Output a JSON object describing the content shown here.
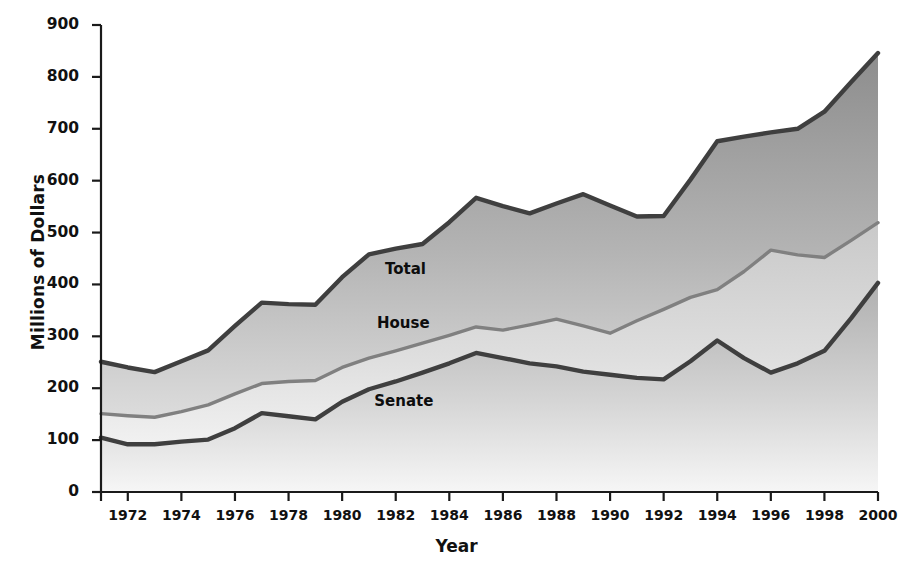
{
  "chart_data": {
    "type": "area",
    "title": "",
    "xlabel": "Year",
    "ylabel": "Millions of Dollars",
    "xlim": [
      1971,
      2000
    ],
    "ylim": [
      0,
      900
    ],
    "grid": false,
    "legend_position": "inline-annotations",
    "stacking": "cumulative-bands",
    "x": [
      1971,
      1972,
      1973,
      1974,
      1975,
      1976,
      1977,
      1978,
      1979,
      1980,
      1981,
      1982,
      1983,
      1984,
      1985,
      1986,
      1987,
      1988,
      1989,
      1990,
      1991,
      1992,
      1993,
      1994,
      1995,
      1996,
      1997,
      1998,
      1999,
      2000
    ],
    "x_tick_labels": [
      "1972",
      "1974",
      "1976",
      "1978",
      "1980",
      "1982",
      "1984",
      "1986",
      "1988",
      "1990",
      "1992",
      "1994",
      "1996",
      "1998",
      "2000"
    ],
    "x_tick_values": [
      1972,
      1974,
      1976,
      1978,
      1980,
      1982,
      1984,
      1986,
      1988,
      1990,
      1992,
      1994,
      1996,
      1998,
      2000
    ],
    "y_tick_labels": [
      "0",
      "100",
      "200",
      "300",
      "400",
      "500",
      "600",
      "700",
      "800",
      "900"
    ],
    "y_tick_values": [
      0,
      100,
      200,
      300,
      400,
      500,
      600,
      700,
      800,
      900
    ],
    "series": [
      {
        "name": "Senate",
        "label": "Senate",
        "color": "#3f3f3f",
        "fill_top": "#b6b6b6",
        "fill_bottom": "#f3f3f3",
        "values": [
          105,
          92,
          92,
          97,
          101,
          123,
          152,
          146,
          140,
          174,
          198,
          213,
          230,
          248,
          268,
          258,
          248,
          242,
          232,
          226,
          220,
          217,
          252,
          292,
          258,
          230,
          248,
          272,
          335,
          403
        ]
      },
      {
        "name": "House",
        "label": "House",
        "color": "#808080",
        "fill_top": "#cfcfcf",
        "fill_bottom": "#f0f0f0",
        "values": [
          151,
          147,
          144,
          155,
          168,
          189,
          209,
          213,
          215,
          240,
          258,
          272,
          287,
          302,
          318,
          312,
          322,
          333,
          320,
          306,
          330,
          352,
          375,
          390,
          425,
          466,
          457,
          452,
          485,
          519
        ]
      },
      {
        "name": "Total",
        "label": "Total",
        "color": "#3f3f3f",
        "fill_top": "#8f8f8f",
        "fill_bottom": "#d8d8d8",
        "values": [
          251,
          240,
          231,
          252,
          273,
          320,
          365,
          362,
          361,
          414,
          458,
          469,
          478,
          520,
          567,
          551,
          537,
          556,
          574,
          552,
          531,
          532,
          602,
          676,
          685,
          693,
          700,
          733,
          790,
          846
        ]
      }
    ],
    "annotations": [
      {
        "text": "Total",
        "x": 1981.6,
        "y": 430
      },
      {
        "text": "House",
        "x": 1981.3,
        "y": 325
      },
      {
        "text": "Senate",
        "x": 1981.2,
        "y": 175
      }
    ]
  },
  "axes": {
    "x_title": "Year",
    "y_title": "Millions of Dollars"
  }
}
